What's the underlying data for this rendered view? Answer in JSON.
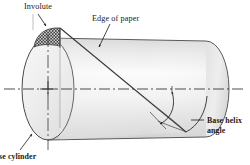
{
  "figure": {
    "type": "technical-line-diagram",
    "canvas": {
      "width": 250,
      "height": 165
    }
  },
  "labels": {
    "involute": "Involute",
    "edge_of_paper": "Edge of paper",
    "base_helix_angle_line1": "Base helix",
    "base_helix_angle_line2": "angle",
    "base_cylinder": "ase cylinder"
  },
  "icons": {
    "involute_leader": "leader-arrow-icon",
    "edge_leader": "leader-arrow-icon",
    "helix_leader": "leader-line-icon",
    "base_cylinder_leader": "leader-arrow-icon",
    "angle_arrow": "double-headed-arc-arrow-icon",
    "center_mark": "center-cross-icon",
    "centerline": "dash-dot-axis-icon"
  },
  "colors": {
    "ink": "#1a1a1a",
    "outline": "#3b3b3b",
    "cylinder_light": "#f2f2f2",
    "cylinder_mid": "#e4e4e4",
    "cylinder_dark": "#d2d2d2",
    "face_fill": "#ececec",
    "hatch": "#4a4a4a",
    "background": "#ffffff"
  },
  "geometry": {
    "cylinder_axis_y": 89,
    "left_face_center_x": 48,
    "left_face_rx": 26,
    "left_face_ry": 51,
    "right_face_center_x": 206,
    "right_face_rx": 23,
    "right_face_ry": 48,
    "helix_start": [
      60,
      28
    ],
    "helix_end": [
      186,
      132
    ],
    "hatch_region": "curved triangular involute sector at top of left face"
  }
}
